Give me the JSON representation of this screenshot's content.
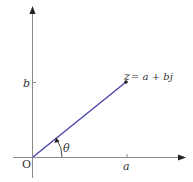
{
  "diagram": {
    "colors": {
      "axis": "#8a8a8a",
      "vector": "#4a44a8",
      "text": "#333333"
    },
    "point": {
      "label_z": "z",
      "label_eq": "= a + bj",
      "name": "z",
      "real": "a",
      "imag": "b"
    },
    "axes": {
      "origin_label": "O",
      "x_tick_label": "a",
      "y_tick_label": "b"
    },
    "angle": {
      "label": "θ"
    }
  }
}
